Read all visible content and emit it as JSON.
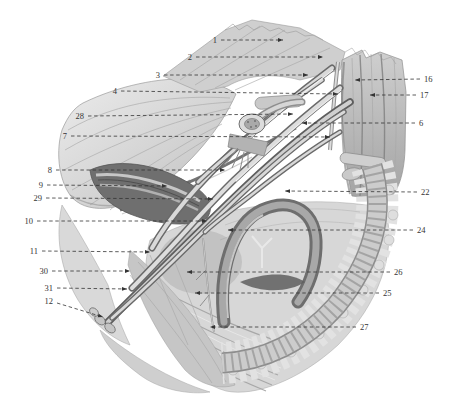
{
  "figure": {
    "style": {
      "ink": "#343434",
      "dash": "3.5 2.6",
      "font_size": 8.5
    },
    "labels": [
      {
        "n": "1",
        "tx": 217,
        "ty": 40,
        "anchor": "end",
        "line": {
          "x1": 221,
          "y1": 40,
          "x2": 283,
          "y2": 40
        }
      },
      {
        "n": "2",
        "tx": 192,
        "ty": 57,
        "anchor": "end",
        "line": {
          "x1": 196,
          "y1": 57,
          "x2": 323,
          "y2": 57
        }
      },
      {
        "n": "3",
        "tx": 160,
        "ty": 75,
        "anchor": "end",
        "line": {
          "x1": 164,
          "y1": 75,
          "x2": 308,
          "y2": 75
        }
      },
      {
        "n": "4",
        "tx": 117,
        "ty": 91,
        "anchor": "end",
        "line": {
          "x1": 121,
          "y1": 91,
          "x2": 338,
          "y2": 94
        }
      },
      {
        "n": "28",
        "tx": 84,
        "ty": 116,
        "anchor": "end",
        "line": {
          "x1": 88,
          "y1": 116,
          "x2": 293,
          "y2": 114
        }
      },
      {
        "n": "7",
        "tx": 67,
        "ty": 136,
        "anchor": "end",
        "line": {
          "x1": 71,
          "y1": 136,
          "x2": 330,
          "y2": 137
        }
      },
      {
        "n": "8",
        "tx": 52,
        "ty": 170,
        "anchor": "end",
        "line": {
          "x1": 56,
          "y1": 170,
          "x2": 225,
          "y2": 170
        }
      },
      {
        "n": "9",
        "tx": 43,
        "ty": 185,
        "anchor": "end",
        "line": {
          "x1": 47,
          "y1": 185,
          "x2": 167,
          "y2": 186
        }
      },
      {
        "n": "29",
        "tx": 42,
        "ty": 198,
        "anchor": "end",
        "line": {
          "x1": 46,
          "y1": 198,
          "x2": 213,
          "y2": 199
        }
      },
      {
        "n": "10",
        "tx": 33,
        "ty": 221,
        "anchor": "end",
        "line": {
          "x1": 37,
          "y1": 221,
          "x2": 207,
          "y2": 221
        }
      },
      {
        "n": "11",
        "tx": 38,
        "ty": 251,
        "anchor": "end",
        "line": {
          "x1": 42,
          "y1": 251,
          "x2": 150,
          "y2": 252
        }
      },
      {
        "n": "30",
        "tx": 48,
        "ty": 271,
        "anchor": "end",
        "line": {
          "x1": 52,
          "y1": 271,
          "x2": 130,
          "y2": 271
        }
      },
      {
        "n": "31",
        "tx": 53,
        "ty": 288,
        "anchor": "end",
        "line": {
          "x1": 57,
          "y1": 288,
          "x2": 127,
          "y2": 289
        }
      },
      {
        "n": "12",
        "tx": 53,
        "ty": 301,
        "anchor": "end",
        "line": {
          "x1": 57,
          "y1": 303,
          "x2": 103,
          "y2": 317
        }
      },
      {
        "n": "16",
        "tx": 424,
        "ty": 79,
        "anchor": "start",
        "line": {
          "x1": 420,
          "y1": 79,
          "x2": 355,
          "y2": 80
        }
      },
      {
        "n": "17",
        "tx": 420,
        "ty": 95,
        "anchor": "start",
        "line": {
          "x1": 416,
          "y1": 95,
          "x2": 370,
          "y2": 95
        }
      },
      {
        "n": "6",
        "tx": 419,
        "ty": 123,
        "anchor": "start",
        "line": {
          "x1": 415,
          "y1": 123,
          "x2": 302,
          "y2": 123
        }
      },
      {
        "n": "22",
        "tx": 421,
        "ty": 192,
        "anchor": "start",
        "line": {
          "x1": 417,
          "y1": 192,
          "x2": 285,
          "y2": 191
        }
      },
      {
        "n": "24",
        "tx": 417,
        "ty": 230,
        "anchor": "start",
        "line": {
          "x1": 413,
          "y1": 230,
          "x2": 228,
          "y2": 230
        }
      },
      {
        "n": "26",
        "tx": 394,
        "ty": 272,
        "anchor": "start",
        "line": {
          "x1": 390,
          "y1": 272,
          "x2": 187,
          "y2": 272
        }
      },
      {
        "n": "25",
        "tx": 383,
        "ty": 293,
        "anchor": "start",
        "line": {
          "x1": 379,
          "y1": 293,
          "x2": 195,
          "y2": 293
        }
      },
      {
        "n": "27",
        "tx": 360,
        "ty": 327,
        "anchor": "start",
        "line": {
          "x1": 356,
          "y1": 327,
          "x2": 210,
          "y2": 327
        }
      }
    ]
  }
}
